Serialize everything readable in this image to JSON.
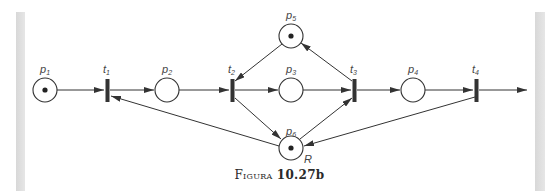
{
  "diagram": {
    "type": "petri-net",
    "places": [
      {
        "id": "p1",
        "label": "p",
        "sub": "1",
        "token": true
      },
      {
        "id": "p2",
        "label": "p",
        "sub": "2",
        "token": false
      },
      {
        "id": "p3",
        "label": "p",
        "sub": "3",
        "token": false
      },
      {
        "id": "p4",
        "label": "p",
        "sub": "4",
        "token": false
      },
      {
        "id": "p5",
        "label": "p",
        "sub": "5",
        "token": true
      },
      {
        "id": "p6",
        "label": "p",
        "sub": "6",
        "token": true,
        "annotation": "R"
      }
    ],
    "transitions": [
      {
        "id": "t1",
        "label": "t",
        "sub": "1"
      },
      {
        "id": "t2",
        "label": "t",
        "sub": "2"
      },
      {
        "id": "t3",
        "label": "t",
        "sub": "3"
      },
      {
        "id": "t4",
        "label": "t",
        "sub": "4"
      }
    ],
    "arcs": [
      [
        "p1",
        "t1"
      ],
      [
        "t1",
        "p2"
      ],
      [
        "p2",
        "t2"
      ],
      [
        "t2",
        "p3"
      ],
      [
        "p3",
        "t3"
      ],
      [
        "t3",
        "p4"
      ],
      [
        "p4",
        "t4"
      ],
      [
        "t4",
        "out"
      ],
      [
        "p5",
        "t2"
      ],
      [
        "t3",
        "p5"
      ],
      [
        "t2",
        "p6"
      ],
      [
        "p6",
        "t1"
      ],
      [
        "p6",
        "t3"
      ],
      [
        "t4",
        "p6"
      ]
    ]
  },
  "caption": {
    "word": "Figura",
    "number": "10.27b"
  }
}
